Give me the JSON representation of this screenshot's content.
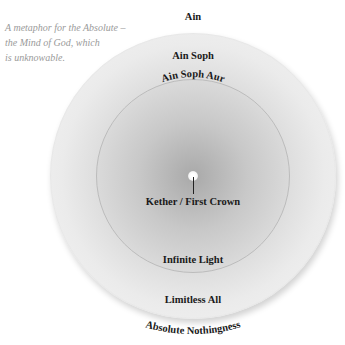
{
  "caption": {
    "lines": [
      "A metaphor for the Absolute –",
      "the Mind of God, which",
      "is unknowable."
    ]
  },
  "labels": {
    "ain": "Ain",
    "ain_soph": "Ain Soph",
    "ain_soph_aur": "Ain Soph Aur",
    "kether": "Kether / First Crown",
    "infinite_light": "Infinite Light",
    "limitless_all": "Limitless All",
    "absolute_nothingness": "Absolute Nothingness"
  }
}
